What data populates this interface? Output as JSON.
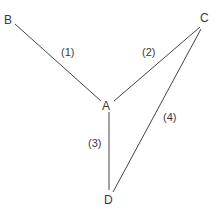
{
  "diagram": {
    "type": "graph",
    "line_color": "#444444",
    "nodes": [
      {
        "id": "B",
        "label": "B"
      },
      {
        "id": "A",
        "label": "A"
      },
      {
        "id": "C",
        "label": "C"
      },
      {
        "id": "D",
        "label": "D"
      }
    ],
    "edges": [
      {
        "from": "B",
        "to": "A",
        "label": "(1)"
      },
      {
        "from": "A",
        "to": "C",
        "label": "(2)"
      },
      {
        "from": "A",
        "to": "D",
        "label": "(3)"
      },
      {
        "from": "C",
        "to": "D",
        "label": "(4)"
      }
    ]
  }
}
